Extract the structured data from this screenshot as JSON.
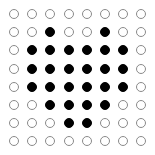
{
  "board": {
    "rows": 8,
    "cols": 8,
    "origin": [
      14,
      14
    ],
    "spacing": 18.2,
    "radius": 5,
    "colors": {
      "on": "#000000",
      "off": "#ffffff",
      "stroke": "#8a8a8a"
    },
    "grid": [
      [
        0,
        0,
        0,
        0,
        0,
        0,
        0,
        0
      ],
      [
        0,
        0,
        1,
        0,
        0,
        1,
        0,
        0
      ],
      [
        0,
        1,
        1,
        1,
        1,
        1,
        1,
        0
      ],
      [
        0,
        1,
        1,
        1,
        1,
        1,
        1,
        0
      ],
      [
        0,
        1,
        1,
        1,
        1,
        1,
        1,
        0
      ],
      [
        0,
        0,
        1,
        1,
        1,
        1,
        0,
        0
      ],
      [
        0,
        0,
        0,
        1,
        1,
        0,
        0,
        0
      ],
      [
        0,
        0,
        0,
        0,
        0,
        0,
        0,
        0
      ]
    ]
  }
}
